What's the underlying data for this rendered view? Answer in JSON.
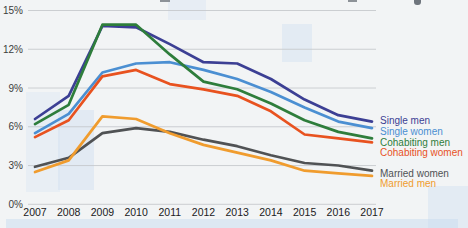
{
  "chart_data": {
    "type": "line",
    "title": "",
    "xlabel": "",
    "ylabel": "",
    "grid": true,
    "legend_position": "right",
    "ylim": [
      0,
      15
    ],
    "y_ticks": [
      {
        "value": 0,
        "label": "0%"
      },
      {
        "value": 3,
        "label": "3%"
      },
      {
        "value": 6,
        "label": "6%"
      },
      {
        "value": 9,
        "label": "9%"
      },
      {
        "value": 12,
        "label": "12%"
      },
      {
        "value": 15,
        "label": "15%"
      }
    ],
    "x": [
      "2007",
      "2008",
      "2009",
      "2010",
      "2011",
      "2012",
      "2013",
      "2014",
      "2015",
      "2016",
      "2017"
    ],
    "series": [
      {
        "name": "Single men",
        "color": "#3c3f94",
        "values": [
          6.6,
          8.4,
          13.8,
          13.7,
          12.4,
          11.0,
          10.9,
          9.7,
          8.1,
          6.9,
          6.4
        ]
      },
      {
        "name": "Single women",
        "color": "#4b8fd2",
        "values": [
          5.5,
          7.0,
          10.2,
          10.9,
          11.0,
          10.4,
          9.7,
          8.7,
          7.5,
          6.4,
          5.9
        ]
      },
      {
        "name": "Cohabiting men",
        "color": "#2e7d3b",
        "values": [
          6.2,
          7.7,
          13.9,
          13.9,
          11.6,
          9.5,
          8.9,
          7.8,
          6.5,
          5.6,
          5.1
        ]
      },
      {
        "name": "Cohabiting women",
        "color": "#e8521f",
        "values": [
          5.2,
          6.5,
          9.9,
          10.4,
          9.3,
          8.9,
          8.4,
          7.2,
          5.4,
          5.1,
          4.8
        ]
      },
      {
        "name": "Married women",
        "color": "#505254",
        "values": [
          2.9,
          3.6,
          5.5,
          5.9,
          5.6,
          5.0,
          4.5,
          3.8,
          3.2,
          3.0,
          2.6
        ]
      },
      {
        "name": "Married men",
        "color": "#f09c2e",
        "values": [
          2.5,
          3.4,
          6.8,
          6.6,
          5.5,
          4.6,
          4.0,
          3.4,
          2.6,
          2.4,
          2.2
        ]
      }
    ]
  }
}
